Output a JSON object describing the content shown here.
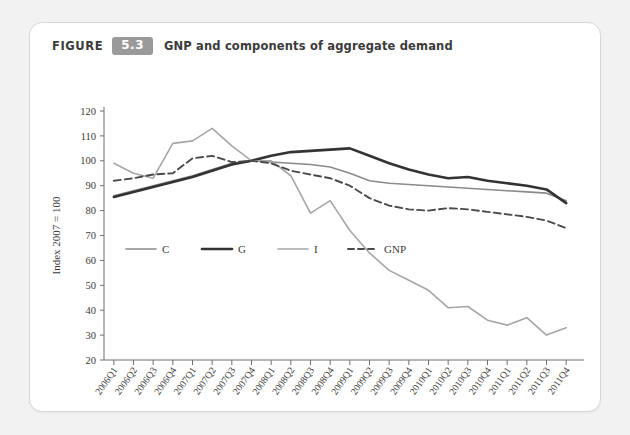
{
  "figure": {
    "label": "FIGURE",
    "number": "5.3",
    "title": "GNP and components of aggregate demand"
  },
  "colors": {
    "card_background": "#ffffff",
    "page_background": "#f2f2f2",
    "card_border": "#d8d8d8",
    "badge_background": "#9a9a9a",
    "axis": "#6f6f6f",
    "series_C": "#8a8a8a",
    "series_G": "#333333",
    "series_I": "#a6a6a6",
    "series_GNP": "#4a4a4a"
  },
  "chart_data": {
    "type": "line",
    "title": "GNP and components of aggregate demand",
    "xlabel": "Year",
    "ylabel": "Index 2007 = 100",
    "ylim": [
      20,
      120
    ],
    "ytick_step": 10,
    "yticks": [
      20,
      30,
      40,
      50,
      60,
      70,
      80,
      90,
      100,
      110,
      120
    ],
    "grid": false,
    "legend_position": "inside-left",
    "categories": [
      "2006Q1",
      "2006Q2",
      "2006Q3",
      "2006Q4",
      "2007Q1",
      "2007Q2",
      "2007Q3",
      "2007Q4",
      "2008Q1",
      "2008Q2",
      "2008Q3",
      "2008Q4",
      "2009Q1",
      "2009Q2",
      "2009Q3",
      "2009Q4",
      "2010Q1",
      "2010Q2",
      "2010Q3",
      "2010Q4",
      "2011Q1",
      "2011Q2",
      "2011Q3",
      "2011Q4"
    ],
    "series": [
      {
        "name": "C",
        "style": "solid",
        "width": 1.6,
        "color": "#8a8a8a",
        "values": [
          86,
          88,
          90,
          92,
          94,
          96.5,
          99,
          100,
          99.5,
          99,
          98.5,
          97.5,
          95,
          92,
          91,
          90.5,
          90,
          89.5,
          89,
          88.5,
          88,
          87.5,
          87,
          84
        ]
      },
      {
        "name": "G",
        "style": "solid",
        "width": 2.6,
        "color": "#333333",
        "values": [
          85.5,
          87.5,
          89.5,
          91.5,
          93.5,
          96,
          98.5,
          100,
          102,
          103.5,
          104,
          104.5,
          105,
          102,
          99,
          96.5,
          94.5,
          93,
          93.5,
          92,
          91,
          90,
          88.5,
          83
        ]
      },
      {
        "name": "I",
        "style": "solid",
        "width": 1.6,
        "color": "#a6a6a6",
        "values": [
          99,
          95,
          93,
          107,
          108,
          113,
          106,
          100,
          100,
          94,
          79,
          84,
          72,
          63,
          56,
          52,
          48,
          41,
          41.5,
          36,
          34,
          37,
          30,
          33
        ]
      },
      {
        "name": "GNP",
        "style": "dashed",
        "width": 1.9,
        "color": "#4a4a4a",
        "values": [
          92,
          93,
          94.5,
          95,
          101,
          102,
          99.5,
          100,
          99,
          96,
          94.5,
          93,
          90,
          85,
          82,
          80.5,
          80,
          81,
          80.5,
          79.5,
          78.5,
          77.5,
          76,
          73
        ]
      }
    ]
  },
  "legend": {
    "items": [
      {
        "label": "C"
      },
      {
        "label": "G"
      },
      {
        "label": "I"
      },
      {
        "label": "GNP"
      }
    ]
  }
}
